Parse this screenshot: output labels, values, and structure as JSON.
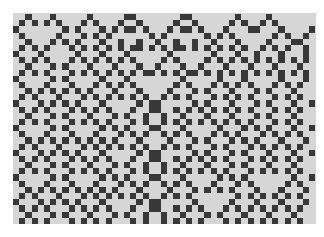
{
  "image": {
    "type": "cellular-automaton-grid",
    "columns": 49,
    "rows": 34,
    "colors": {
      "page_background": "#ffffff",
      "cell_off": "#d6d6d6",
      "cell_on": "#383838"
    },
    "grid": [
      "..#...#.....#.....##.......##.......#....#.......",
      ".#.#.#.#...#.#...#..#.....#..#.....#.#..#.#......",
      "#.......#.#...#.#.##.#...#.##.#...#...##...#....#",
      ".#.....#...#.#.#......#.#......#.#.#......#.#..#.",
      "..#...#.#.#...#..#..#..#..#..#..#...#....#...##..",
      ".#.#.#...#.#.#.#.#.##.#.#.##.#.#.#.#.#..#.#.#..#.",
      "#...#.....#...#...#......#......#...#..#...#...#.",
      ".#.#.#...#.#.#.#.#.#....#.#....#.#.#.#.#.#.#.#.#.",
      "..#...#.#...#...#...#..#...#..#...#...#...#...#..",
      ".#.#.#...#.#.#.#.#.#.##.#.#.##.#.#.#.#.#.#.#.#.#.",
      "#.....#.#.....#...#........#.....#...#.....#...#.",
      ".#...#...#...#.#.#.#......#.#...#.#.#.#...#.#.#..",
      "..#.#.#.#.#.#...#...#....#...#.#...#...#.#...#...",
      ".#.#...#...#.#.#.#.#.#..#.#.#...#.#.#.#...#.#.#..",
      "#...#.#.#.#...#.....#.##.....#.#...#...#.#...#..#",
      ".#.#.#...#.#.#.#...#..##..#.#.#.#.#.#.#...#.#.#..",
      "..#...#.#...#...#.#..#..#..#...#...#...#.#...#...",
      ".#.#.#...#.#.#.#...#.#..#.#.#.#.#.#.#.#...#.#.#..",
      "#.....#.#.....#.#.#...##...#.....#...#.#.#...#..#",
      ".#...#...#...#...#.#.#..#.#.#...#.#.#...#.#.#.#..",
      "..#.#.#.#.#.#.#.#...#....#...#.#...#.#.#...#...#.",
      ".#.#...#...#.#.#.#.#.#..#.#.#...#.#...#.#.#.#.#..",
      "#...#.#.#.#...#.....#.##.....#.#...#.#...#...#..#",
      ".#.#.#...#.#.#.#...#..##..#.#.#.#.#...#.#.#.#.#..",
      "..#...#.#...#...#.#..#..#..#...#...#.#...#...#...",
      ".#.#.#...#.#.#.#...#.#..#.#.#.#.#.#...#.#.#.#.#..",
      "#.....#.#.....#.#.#...##...#.....#.#.#.......#..#",
      ".#...#...#...#...#.#.#..#.#.#...#...#.#.....#.#..",
      "..#.#.#.#.#.#.#.#...#....#...#.#.#.#...#...#...#.",
      ".#.#...#...#.#.#.#.#.#..#.#.#.......#.#.#.#.#.#..",
      "#...#.#.#.#...#.....#.##.....#.....#...#...#...#.",
      ".#.#.#...#.#.#.#...#..##..#.#.#...#.#.#.#.#.#.#..",
      "..#...#.#...#...#.#..#..#..#...#.#...#...#...#...",
      ".#.#.#...#.#.#.#...#.#..#.#.#.#...#.#.#.#.#.#.#.."
    ]
  }
}
